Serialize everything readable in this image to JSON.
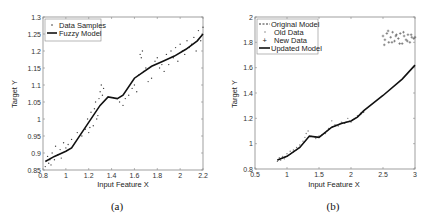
{
  "chart_data": [
    {
      "type": "scatter",
      "caption": "(a)",
      "xlabel": "Input Feature X",
      "ylabel": "Target Y",
      "xlim": [
        0.8,
        2.2
      ],
      "ylim": [
        0.85,
        1.3
      ],
      "xticks": [
        0.8,
        1,
        1.2,
        1.4,
        1.6,
        1.8,
        2,
        2.2
      ],
      "xtick_labels": [
        "0.8",
        "1",
        "1.2",
        "1.4",
        "1.6",
        "1.8",
        "2",
        "2.2"
      ],
      "yticks": [
        0.85,
        0.9,
        0.95,
        1,
        1.05,
        1.1,
        1.15,
        1.2,
        1.25,
        1.3
      ],
      "ytick_labels": [
        "0.85",
        "0.9",
        "0.95",
        "1",
        "1.05",
        "1.1",
        "1.15",
        "1.2",
        "1.25",
        "1.3"
      ],
      "legend": {
        "placement": "top-left",
        "entries": [
          "Data Samples",
          "Fuzzy Model"
        ]
      },
      "series": [
        {
          "name": "Fuzzy Model",
          "kind": "line",
          "x": [
            0.82,
            0.9,
            1.0,
            1.05,
            1.1,
            1.2,
            1.3,
            1.37,
            1.45,
            1.5,
            1.6,
            1.75,
            1.85,
            1.95,
            2.05,
            2.15,
            2.2
          ],
          "y": [
            0.875,
            0.89,
            0.905,
            0.915,
            0.94,
            0.99,
            1.04,
            1.065,
            1.06,
            1.07,
            1.12,
            1.155,
            1.17,
            1.185,
            1.205,
            1.23,
            1.25
          ]
        },
        {
          "name": "Data Samples",
          "kind": "points",
          "x": [
            0.82,
            0.84,
            0.85,
            0.86,
            0.87,
            0.88,
            0.9,
            0.91,
            0.93,
            0.95,
            0.96,
            0.98,
            1.0,
            1.02,
            1.05,
            1.1,
            1.14,
            1.17,
            1.19,
            1.2,
            1.21,
            1.22,
            1.24,
            1.25,
            1.26,
            1.27,
            1.28,
            1.29,
            1.3,
            1.31,
            1.32,
            1.33,
            1.45,
            1.47,
            1.5,
            1.52,
            1.55,
            1.58,
            1.6,
            1.62,
            1.64,
            1.65,
            1.66,
            1.67,
            1.68,
            1.7,
            1.72,
            1.75,
            1.78,
            1.8,
            1.82,
            1.84,
            1.86,
            1.88,
            1.9,
            1.92,
            1.94,
            1.96,
            1.98,
            2.0,
            2.02,
            2.04,
            2.06,
            2.08,
            2.1,
            2.12,
            2.14,
            2.16,
            2.18,
            2.2
          ],
          "y": [
            0.86,
            0.89,
            0.87,
            0.88,
            0.865,
            0.9,
            0.88,
            0.92,
            0.895,
            0.91,
            0.885,
            0.93,
            0.915,
            0.925,
            0.94,
            0.96,
            0.95,
            0.97,
            1.0,
            0.96,
            0.975,
            1.02,
            0.98,
            1.03,
            1.05,
            1.0,
            1.01,
            1.06,
            1.08,
            1.1,
            1.07,
            1.09,
            1.06,
            1.05,
            1.04,
            1.06,
            1.07,
            1.09,
            1.1,
            1.08,
            1.13,
            1.19,
            1.18,
            1.2,
            1.14,
            1.15,
            1.11,
            1.12,
            1.17,
            1.18,
            1.15,
            1.16,
            1.14,
            1.19,
            1.16,
            1.2,
            1.18,
            1.21,
            1.17,
            1.22,
            1.2,
            1.19,
            1.23,
            1.21,
            1.22,
            1.24,
            1.2,
            1.26,
            1.23,
            1.27
          ]
        }
      ]
    },
    {
      "type": "scatter",
      "caption": "(b)",
      "xlabel": "Input Feature X",
      "ylabel": "Target Y",
      "xlim": [
        0.5,
        3
      ],
      "ylim": [
        0.8,
        2
      ],
      "xticks": [
        0.5,
        1,
        1.5,
        2,
        2.5,
        3
      ],
      "xtick_labels": [
        "0.5",
        "1",
        "1.5",
        "2",
        "2.5",
        "3"
      ],
      "yticks": [
        0.8,
        1,
        1.2,
        1.4,
        1.6,
        1.8,
        2
      ],
      "ytick_labels": [
        "0.8",
        "1",
        "1.2",
        "1.4",
        "1.6",
        "1.8",
        "2"
      ],
      "legend": {
        "placement": "top-left",
        "entries": [
          "Original Model",
          "Old Data",
          "New Data",
          "Updated Model"
        ]
      },
      "series": [
        {
          "name": "Updated Model",
          "kind": "line",
          "x": [
            0.85,
            1.0,
            1.2,
            1.35,
            1.5,
            1.7,
            1.85,
            2.0,
            2.1,
            2.2,
            2.5,
            2.8,
            3.0
          ],
          "y": [
            0.87,
            0.9,
            0.97,
            1.06,
            1.05,
            1.13,
            1.16,
            1.18,
            1.21,
            1.26,
            1.38,
            1.51,
            1.62
          ]
        },
        {
          "name": "Original Model",
          "kind": "dashed",
          "x": [
            0.85,
            1.0,
            1.2,
            1.35,
            1.5,
            1.7,
            1.85,
            2.0,
            2.1,
            2.2
          ],
          "y": [
            0.87,
            0.9,
            0.97,
            1.06,
            1.05,
            1.13,
            1.16,
            1.18,
            1.21,
            1.25
          ]
        },
        {
          "name": "Old Data",
          "kind": "points",
          "x": [
            0.85,
            0.88,
            0.9,
            0.93,
            0.96,
            1.0,
            1.05,
            1.1,
            1.15,
            1.2,
            1.25,
            1.28,
            1.3,
            1.33,
            1.45,
            1.5,
            1.55,
            1.6,
            1.65,
            1.7,
            1.75,
            1.8,
            1.85,
            1.9,
            1.95,
            2.0,
            2.05,
            2.1,
            2.15,
            2.2
          ],
          "y": [
            0.86,
            0.89,
            0.87,
            0.9,
            0.88,
            0.92,
            0.94,
            0.95,
            0.97,
            0.99,
            1.02,
            1.05,
            1.08,
            1.1,
            1.04,
            1.06,
            1.07,
            1.08,
            1.12,
            1.18,
            1.15,
            1.14,
            1.17,
            1.16,
            1.2,
            1.17,
            1.2,
            1.22,
            1.24,
            1.25
          ]
        },
        {
          "name": "New Data",
          "kind": "points",
          "x": [
            2.5,
            2.53,
            2.56,
            2.59,
            2.62,
            2.65,
            2.68,
            2.71,
            2.74,
            2.77,
            2.8,
            2.83,
            2.86,
            2.89,
            2.92,
            2.95,
            2.98,
            2.52,
            2.58,
            2.64,
            2.7,
            2.76,
            2.82,
            2.88,
            2.94,
            3.0
          ],
          "y": [
            1.85,
            1.82,
            1.87,
            1.8,
            1.84,
            1.88,
            1.81,
            1.86,
            1.83,
            1.87,
            1.79,
            1.85,
            1.82,
            1.86,
            1.8,
            1.84,
            1.83,
            1.78,
            1.89,
            1.8,
            1.85,
            1.79,
            1.88,
            1.81,
            1.86,
            1.84
          ]
        }
      ]
    }
  ]
}
